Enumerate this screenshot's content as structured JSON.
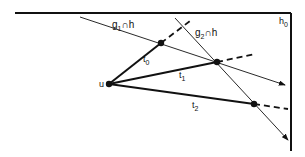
{
  "diagram": {
    "labels": {
      "g1h": {
        "base": "g",
        "sub": "1",
        "rest": "∩h"
      },
      "g2h": {
        "base": "g",
        "sub": "2",
        "rest": "∩h"
      },
      "h0": {
        "base": "h",
        "sub": "0"
      },
      "u": "u",
      "t0": {
        "base": "t",
        "sub": "0"
      },
      "t1": {
        "base": "t",
        "sub": "1"
      },
      "t2": {
        "base": "t",
        "sub": "2"
      }
    },
    "colors": {
      "stroke": "#111111",
      "background": "#ffffff"
    }
  }
}
